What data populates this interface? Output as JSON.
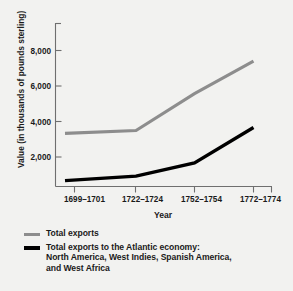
{
  "chart_data": {
    "type": "line",
    "title": "",
    "xlabel": "Year",
    "ylabel": "Value (in thousands of pounds sterling)",
    "categories": [
      "1699–1701",
      "1722–1724",
      "1752–1754",
      "1772–1774"
    ],
    "yticks": [
      "2,000",
      "4,000",
      "6,000",
      "8,000"
    ],
    "ytick_values": [
      2000,
      4000,
      6000,
      8000
    ],
    "ylim": [
      0,
      9400
    ],
    "grid": false,
    "legend_position": "below",
    "series": [
      {
        "name": "Total exports",
        "color": "#8d8d8d",
        "values": [
          3600,
          3800,
          6300,
          8500
        ]
      },
      {
        "name": "Total exports to the Atlantic economy: North America, West Indies, Spanish America, and West Africa",
        "color": "#000000",
        "values": [
          400,
          700,
          1600,
          4000
        ]
      }
    ]
  },
  "axes": {
    "ylabel": "Value (in thousands of pounds sterling)",
    "xlabel": "Year",
    "ytick_labels": [
      "8,000",
      "6,000",
      "4,000",
      "2,000"
    ],
    "xtick_labels": [
      "1699–1701",
      "1722–1724",
      "1752–1754",
      "1772–1774"
    ]
  },
  "legend": {
    "entries": [
      {
        "label": "Total exports",
        "line2": "",
        "line3": "",
        "color": "#8d8d8d"
      },
      {
        "label": "Total exports to the Atlantic economy:",
        "line2": "North America, West Indies, Spanish America,",
        "line3": "and West Africa",
        "color": "#000000"
      }
    ]
  },
  "colors": {
    "background": "#f2f2f0",
    "axis": "#6f6f6f",
    "series_total": "#8d8d8d",
    "series_atlantic": "#000000",
    "text": "#1a1a1a"
  }
}
